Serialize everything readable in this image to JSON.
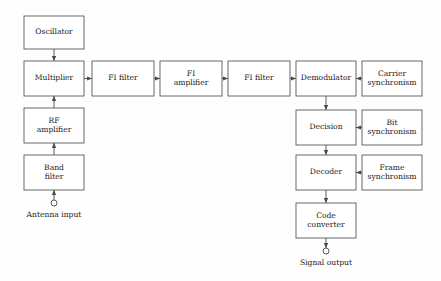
{
  "diagram": {
    "background_color": "#fefefe",
    "line_color": "#4a4a4a",
    "box_fill": "#ffffff",
    "text_color": "#222222",
    "blocks": [
      {
        "id": "oscillator",
        "label": "Oscillator",
        "lines": [
          "Oscillator"
        ],
        "x": 24,
        "y": 16,
        "w": 60,
        "h": 33
      },
      {
        "id": "multiplier",
        "label": "Multiplier",
        "lines": [
          "Multiplier"
        ],
        "x": 24,
        "y": 61,
        "w": 60,
        "h": 35
      },
      {
        "id": "rf-amplifier",
        "label": "RF amplifier",
        "lines": [
          "RF",
          "amplifier"
        ],
        "x": 24,
        "y": 108,
        "w": 60,
        "h": 35
      },
      {
        "id": "band-filter",
        "label": "Band filter",
        "lines": [
          "Band",
          "filter"
        ],
        "x": 24,
        "y": 155,
        "w": 60,
        "h": 35
      },
      {
        "id": "fi-filter-1",
        "label": "FI filter",
        "lines": [
          "FI filter"
        ],
        "x": 92,
        "y": 61,
        "w": 62,
        "h": 35
      },
      {
        "id": "fi-amplifier",
        "label": "FI amplifier",
        "lines": [
          "FI",
          "amplifier"
        ],
        "x": 160,
        "y": 61,
        "w": 62,
        "h": 35
      },
      {
        "id": "fi-filter-2",
        "label": "FI filter",
        "lines": [
          "FI filter"
        ],
        "x": 228,
        "y": 61,
        "w": 62,
        "h": 35
      },
      {
        "id": "demodulator",
        "label": "Demodulator",
        "lines": [
          "Demodulator"
        ],
        "x": 296,
        "y": 61,
        "w": 60,
        "h": 35
      },
      {
        "id": "carrier-synchronism",
        "label": "Carrier synchronism",
        "lines": [
          "Carrier",
          "synchronism"
        ],
        "x": 362,
        "y": 61,
        "w": 60,
        "h": 35
      },
      {
        "id": "decision",
        "label": "Decision",
        "lines": [
          "Decision"
        ],
        "x": 296,
        "y": 110,
        "w": 60,
        "h": 35
      },
      {
        "id": "bit-synchronism",
        "label": "Bit synchronism",
        "lines": [
          "Bit",
          "synchronism"
        ],
        "x": 362,
        "y": 110,
        "w": 60,
        "h": 35
      },
      {
        "id": "decoder",
        "label": "Decoder",
        "lines": [
          "Decoder"
        ],
        "x": 296,
        "y": 155,
        "w": 60,
        "h": 35
      },
      {
        "id": "frame-synchronism",
        "label": "Frame synchronism",
        "lines": [
          "Frame",
          "synchronism"
        ],
        "x": 362,
        "y": 155,
        "w": 60,
        "h": 35
      },
      {
        "id": "code-converter",
        "label": "Code converter",
        "lines": [
          "Code",
          "converter"
        ],
        "x": 296,
        "y": 203,
        "w": 60,
        "h": 35
      }
    ],
    "terminals": [
      {
        "id": "antenna-input",
        "label": "Antenna input",
        "cx": 54,
        "cy": 203,
        "r": 3,
        "label_x": 54,
        "label_y": 215
      },
      {
        "id": "signal-output",
        "label": "Signal output",
        "cx": 326,
        "cy": 251,
        "r": 3,
        "label_x": 326,
        "label_y": 263
      }
    ],
    "connections": [
      {
        "id": "oscillator-to-multiplier",
        "from": "oscillator",
        "to": "multiplier",
        "direction": "down"
      },
      {
        "id": "band-filter-to-rf-amplifier",
        "from": "band-filter",
        "to": "rf-amplifier",
        "direction": "up"
      },
      {
        "id": "rf-amplifier-to-multiplier",
        "from": "rf-amplifier",
        "to": "multiplier",
        "direction": "up"
      },
      {
        "id": "antenna-to-band-filter",
        "from": "antenna-input",
        "to": "band-filter",
        "direction": "up"
      },
      {
        "id": "multiplier-to-fi-filter-1",
        "from": "multiplier",
        "to": "fi-filter-1",
        "direction": "right"
      },
      {
        "id": "fi-filter-1-to-fi-amplifier",
        "from": "fi-filter-1",
        "to": "fi-amplifier",
        "direction": "right"
      },
      {
        "id": "fi-amplifier-to-fi-filter-2",
        "from": "fi-amplifier",
        "to": "fi-filter-2",
        "direction": "right"
      },
      {
        "id": "fi-filter-2-to-demodulator",
        "from": "fi-filter-2",
        "to": "demodulator",
        "direction": "right"
      },
      {
        "id": "carrier-sync-to-demodulator",
        "from": "carrier-synchronism",
        "to": "demodulator",
        "direction": "left"
      },
      {
        "id": "demodulator-to-decision",
        "from": "demodulator",
        "to": "decision",
        "direction": "down"
      },
      {
        "id": "bit-sync-to-decision",
        "from": "bit-synchronism",
        "to": "decision",
        "direction": "left"
      },
      {
        "id": "decision-to-decoder",
        "from": "decision",
        "to": "decoder",
        "direction": "down"
      },
      {
        "id": "frame-sync-to-decoder",
        "from": "frame-synchronism",
        "to": "decoder",
        "direction": "left"
      },
      {
        "id": "decoder-to-code-converter",
        "from": "decoder",
        "to": "code-converter",
        "direction": "down"
      },
      {
        "id": "code-converter-to-signal-output",
        "from": "code-converter",
        "to": "signal-output",
        "direction": "down"
      }
    ]
  }
}
